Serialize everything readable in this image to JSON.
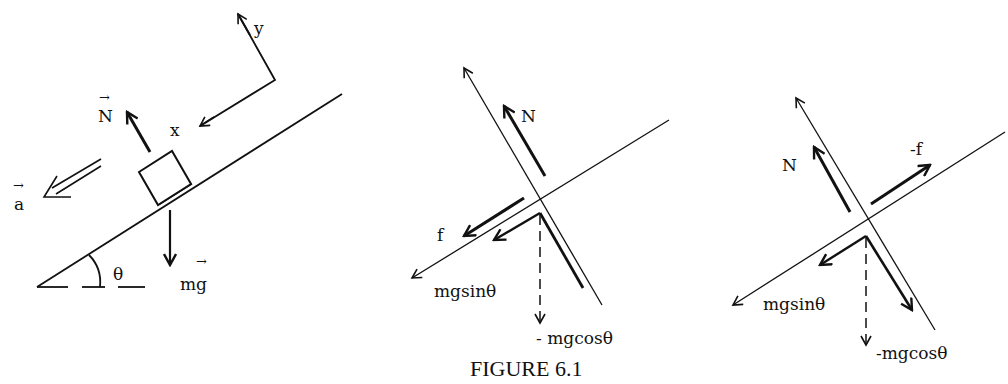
{
  "figure": {
    "caption": "FIGURE 6.1",
    "ink_color": "#111111",
    "background": "#ffffff"
  },
  "panel1": {
    "title": "block on incline",
    "labels": {
      "normal": "N",
      "accel": "a",
      "weight": "mg",
      "angle": "θ",
      "axis_x": "x",
      "axis_y": "y",
      "vec_mark": "→"
    }
  },
  "panel2": {
    "labels": {
      "normal": "N",
      "friction": "f",
      "parallel": "mgsinθ",
      "perp": "- mgcosθ"
    }
  },
  "panel3": {
    "labels": {
      "normal": "N",
      "friction": "-f",
      "parallel": "mgsinθ",
      "perp": "-mgcosθ"
    }
  }
}
